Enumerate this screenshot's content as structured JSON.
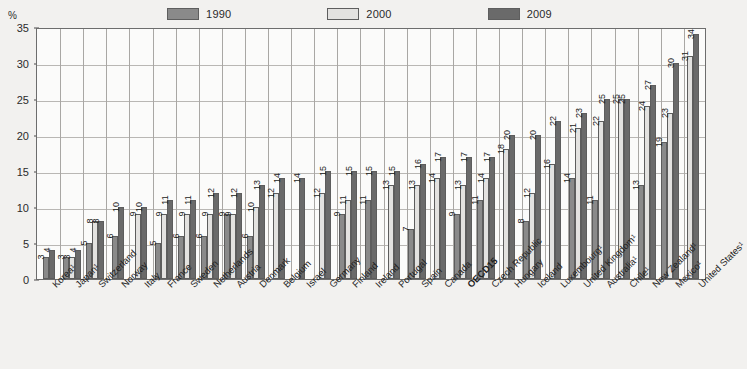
{
  "chart_data": {
    "type": "bar",
    "title": "",
    "subtitle": "",
    "xlabel": "",
    "ylabel": "",
    "yunit": "%",
    "ylim": [
      0,
      35
    ],
    "yticks": [
      0,
      5,
      10,
      15,
      20,
      25,
      30,
      35
    ],
    "grid": true,
    "legend_position": "top-center",
    "series": [
      {
        "name": "1990",
        "color": "#8a8a8a",
        "values": [
          3,
          3,
          5,
          6,
          null,
          5,
          6,
          6,
          9,
          6,
          null,
          null,
          null,
          9,
          11,
          null,
          7,
          null,
          9,
          11,
          null,
          8,
          null,
          14,
          11,
          null,
          13,
          19,
          null
        ]
      },
      {
        "name": "2000",
        "color": "#e3e2e0",
        "values": [
          null,
          3,
          8,
          null,
          9,
          9,
          9,
          9,
          9,
          10,
          12,
          null,
          12,
          11,
          null,
          13,
          13,
          14,
          13,
          14,
          18,
          12,
          16,
          21,
          22,
          25,
          24,
          23,
          31
        ]
      },
      {
        "name": "2009",
        "color": "#6a6a6a",
        "values": [
          4,
          4,
          8,
          10,
          10,
          11,
          11,
          12,
          12,
          13,
          14,
          14,
          15,
          15,
          15,
          15,
          16,
          17,
          17,
          17,
          20,
          20,
          22,
          23,
          25,
          25,
          27,
          30,
          34
        ]
      }
    ],
    "categories": [
      {
        "label": "Korea¹",
        "bold": false
      },
      {
        "label": "Japan¹",
        "bold": false
      },
      {
        "label": "Switzerland",
        "bold": false
      },
      {
        "label": "Norway",
        "bold": false
      },
      {
        "label": "Italy",
        "bold": false
      },
      {
        "label": "France",
        "bold": false
      },
      {
        "label": "Sweden",
        "bold": false
      },
      {
        "label": "Netherlands",
        "bold": false
      },
      {
        "label": "Austria",
        "bold": false
      },
      {
        "label": "Denmark",
        "bold": false
      },
      {
        "label": "Belgium",
        "bold": false
      },
      {
        "label": "Israel",
        "bold": false
      },
      {
        "label": "Germany",
        "bold": false
      },
      {
        "label": "Finland",
        "bold": false
      },
      {
        "label": "Ireland",
        "bold": false
      },
      {
        "label": "Portugal",
        "bold": false
      },
      {
        "label": "Spain",
        "bold": false
      },
      {
        "label": "Canada",
        "bold": false
      },
      {
        "label": "OECD15",
        "bold": true
      },
      {
        "label": "Czech Republic",
        "bold": false
      },
      {
        "label": "Hungary",
        "bold": false
      },
      {
        "label": "Iceland",
        "bold": false
      },
      {
        "label": "Luxembourg¹",
        "bold": false
      },
      {
        "label": "United Kingdom¹",
        "bold": false
      },
      {
        "label": "Australia¹",
        "bold": false
      },
      {
        "label": "Chile¹",
        "bold": false
      },
      {
        "label": "New Zealand¹",
        "bold": false
      },
      {
        "label": "Mexico¹",
        "bold": false
      },
      {
        "label": "United States¹",
        "bold": false
      }
    ]
  }
}
